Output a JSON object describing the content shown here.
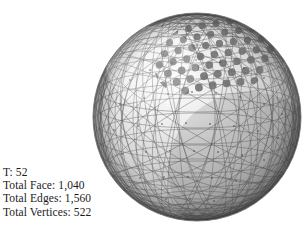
{
  "figure": {
    "caption_lines": [
      {
        "label": "T",
        "value": "52",
        "text": "T: 52"
      },
      {
        "label": "Total Face",
        "value": "1,040",
        "text": "Total Face: 1,040"
      },
      {
        "label": "Total Edges",
        "value": "1,560",
        "text": "Total Edges: 1,560"
      },
      {
        "label": "Total Vertices",
        "value": "522",
        "text": "Total Vertices: 522"
      }
    ],
    "object": {
      "name": "geodesic-sphere",
      "description": "Triangulated geodesic sphere with a patch of dark circular nodes",
      "center_x": 197,
      "center_y": 117,
      "radius": 104,
      "mesh_color": "#5a5a5a",
      "dot_color": "#6e6e6e",
      "highlight_color": "#fdfdfd",
      "shadow_color": "#6a6a6a",
      "background_color": "#ffffff"
    }
  }
}
